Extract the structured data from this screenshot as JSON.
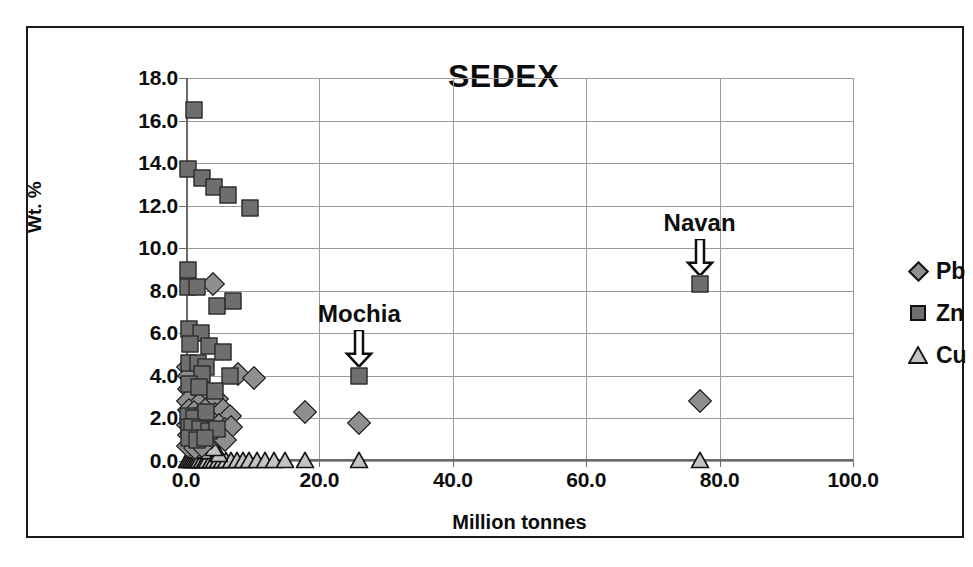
{
  "chart_data": {
    "type": "scatter",
    "title": "SEDEX",
    "xlabel": "Million tonnes",
    "ylabel": "Wt. %",
    "xlim": [
      0,
      100
    ],
    "ylim": [
      0,
      18
    ],
    "xticks": [
      "0.0",
      "20.0",
      "40.0",
      "60.0",
      "80.0",
      "100.0"
    ],
    "xtick_values": [
      0,
      20,
      40,
      60,
      80,
      100
    ],
    "yticks": [
      "0.0",
      "2.0",
      "4.0",
      "6.0",
      "8.0",
      "10.0",
      "12.0",
      "14.0",
      "16.0",
      "18.0"
    ],
    "ytick_values": [
      0,
      2,
      4,
      6,
      8,
      10,
      12,
      14,
      16,
      18
    ],
    "grid": true,
    "legend_position": "right",
    "legend": [
      {
        "name": "Pb",
        "marker": "diamond",
        "color": "#8f8f8f"
      },
      {
        "name": "Zn",
        "marker": "square",
        "color": "#6e6e6e"
      },
      {
        "name": "Cu",
        "marker": "triangle",
        "color": "#c2c2c2"
      }
    ],
    "annotations": [
      {
        "label": "Mochia",
        "x": 26.0,
        "y": 4.0,
        "text_y": 6.9,
        "arrow": "down"
      },
      {
        "label": "Navan",
        "x": 77.0,
        "y": 8.3,
        "text_y": 11.2,
        "arrow": "down"
      }
    ],
    "series": [
      {
        "name": "Zn",
        "marker": "square",
        "color": "#6e6e6e",
        "points": [
          [
            1.2,
            16.5
          ],
          [
            0.3,
            13.7
          ],
          [
            2.4,
            13.3
          ],
          [
            4.2,
            12.9
          ],
          [
            6.3,
            12.5
          ],
          [
            9.6,
            11.9
          ],
          [
            0.3,
            9.0
          ],
          [
            0.3,
            8.2
          ],
          [
            1.6,
            8.2
          ],
          [
            4.6,
            7.3
          ],
          [
            7.0,
            7.5
          ],
          [
            0.5,
            6.2
          ],
          [
            2.2,
            6.0
          ],
          [
            0.6,
            5.5
          ],
          [
            3.5,
            5.4
          ],
          [
            5.6,
            5.1
          ],
          [
            0.5,
            4.6
          ],
          [
            1.8,
            4.6
          ],
          [
            3.0,
            4.4
          ],
          [
            2.4,
            4.1
          ],
          [
            6.6,
            4.0
          ],
          [
            0.4,
            3.6
          ],
          [
            2.0,
            3.5
          ],
          [
            4.4,
            3.3
          ],
          [
            26.0,
            4.0
          ],
          [
            0.3,
            2.1
          ],
          [
            1.2,
            2.0
          ],
          [
            3.0,
            2.3
          ],
          [
            0.4,
            1.6
          ],
          [
            0.9,
            1.6
          ],
          [
            2.1,
            1.5
          ],
          [
            3.4,
            1.4
          ],
          [
            4.6,
            1.5
          ],
          [
            0.5,
            1.1
          ],
          [
            1.7,
            1.0
          ],
          [
            2.8,
            1.1
          ],
          [
            77.0,
            8.3
          ]
        ]
      },
      {
        "name": "Pb",
        "marker": "diamond",
        "color": "#8f8f8f",
        "points": [
          [
            4.0,
            8.3
          ],
          [
            0.3,
            4.4
          ],
          [
            1.0,
            4.3
          ],
          [
            0.4,
            4.0
          ],
          [
            0.5,
            3.4
          ],
          [
            1.4,
            3.3
          ],
          [
            2.5,
            3.1
          ],
          [
            0.3,
            2.8
          ],
          [
            1.9,
            2.7
          ],
          [
            3.4,
            2.6
          ],
          [
            4.6,
            2.9
          ],
          [
            7.8,
            4.1
          ],
          [
            10.2,
            3.9
          ],
          [
            0.4,
            2.4
          ],
          [
            1.2,
            2.3
          ],
          [
            2.2,
            2.2
          ],
          [
            3.2,
            2.1
          ],
          [
            4.4,
            2.2
          ],
          [
            5.6,
            2.4
          ],
          [
            6.6,
            2.1
          ],
          [
            17.8,
            2.3
          ],
          [
            26.0,
            1.8
          ],
          [
            0.3,
            1.7
          ],
          [
            0.8,
            1.6
          ],
          [
            1.5,
            1.7
          ],
          [
            2.3,
            1.5
          ],
          [
            3.1,
            1.6
          ],
          [
            4.0,
            1.5
          ],
          [
            4.9,
            1.7
          ],
          [
            5.8,
            1.5
          ],
          [
            6.8,
            1.6
          ],
          [
            0.4,
            1.2
          ],
          [
            1.1,
            1.1
          ],
          [
            2.0,
            1.2
          ],
          [
            2.9,
            1.0
          ],
          [
            3.8,
            1.1
          ],
          [
            4.8,
            1.2
          ],
          [
            5.9,
            1.0
          ],
          [
            0.3,
            0.7
          ],
          [
            1.3,
            0.6
          ],
          [
            2.4,
            0.7
          ],
          [
            77.0,
            2.8
          ]
        ]
      },
      {
        "name": "Cu",
        "marker": "triangle",
        "color": "#c2c2c2",
        "points": [
          [
            0.2,
            0.05
          ],
          [
            0.5,
            0.05
          ],
          [
            0.8,
            0.05
          ],
          [
            1.1,
            0.05
          ],
          [
            1.4,
            0.05
          ],
          [
            1.7,
            0.05
          ],
          [
            2.0,
            0.05
          ],
          [
            2.4,
            0.05
          ],
          [
            2.8,
            0.05
          ],
          [
            3.2,
            0.05
          ],
          [
            3.7,
            0.05
          ],
          [
            4.2,
            0.05
          ],
          [
            4.8,
            0.05
          ],
          [
            5.4,
            0.05
          ],
          [
            6.0,
            0.05
          ],
          [
            6.8,
            0.05
          ],
          [
            7.6,
            0.05
          ],
          [
            8.5,
            0.05
          ],
          [
            9.5,
            0.05
          ],
          [
            10.6,
            0.05
          ],
          [
            11.8,
            0.05
          ],
          [
            13.2,
            0.05
          ],
          [
            14.8,
            0.05
          ],
          [
            17.8,
            0.05
          ],
          [
            26.0,
            0.05
          ],
          [
            77.0,
            0.05
          ],
          [
            2.6,
            0.45
          ],
          [
            5.0,
            0.35
          ],
          [
            0.6,
            0.9
          ],
          [
            2.9,
            0.8
          ],
          [
            4.2,
            0.6
          ],
          [
            1.0,
            0.5
          ],
          [
            3.6,
            1.3
          ]
        ]
      }
    ]
  }
}
